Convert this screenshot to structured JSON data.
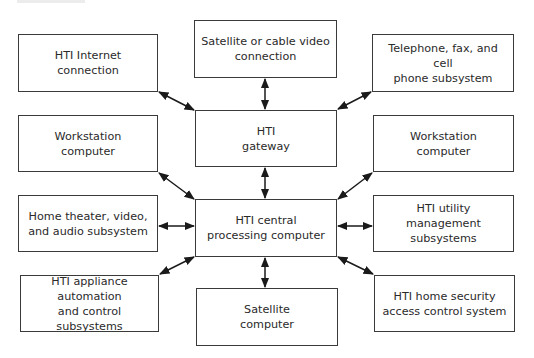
{
  "diagram": {
    "type": "block-diagram",
    "hub": "central",
    "colors": {
      "border": "#3a3a3a",
      "text": "#2a2a2a",
      "arrow": "#1a1a1a",
      "background": "#ffffff"
    },
    "nodes": {
      "internet": {
        "line1": "HTI Internet",
        "line2": "connection"
      },
      "satellite_video": {
        "line1": "Satellite or cable video",
        "line2": "connection"
      },
      "telephone": {
        "line1": "Telephone, fax, and cell",
        "line2": "phone subsystem"
      },
      "workstation_left": {
        "line1": "Workstation",
        "line2": "computer"
      },
      "gateway": {
        "line1": "HTI",
        "line2": "gateway"
      },
      "workstation_right": {
        "line1": "Workstation",
        "line2": "computer"
      },
      "home_theater": {
        "line1": "Home theater, video,",
        "line2": "and audio subsystem"
      },
      "central": {
        "line1": "HTI central",
        "line2": "processing computer"
      },
      "utility": {
        "line1": "HTI utility",
        "line2": "management subsystems"
      },
      "appliance": {
        "line1": "HTI appliance automation",
        "line2": "and control subsystems"
      },
      "satellite_computer": {
        "line1": "Satellite",
        "line2": "computer"
      },
      "security": {
        "line1": "HTI home security",
        "line2": "access control system"
      }
    },
    "edges": [
      {
        "from": "internet",
        "to": "gateway",
        "bidirectional": true
      },
      {
        "from": "satellite_video",
        "to": "gateway",
        "bidirectional": true
      },
      {
        "from": "telephone",
        "to": "gateway",
        "bidirectional": true
      },
      {
        "from": "gateway",
        "to": "central",
        "bidirectional": true
      },
      {
        "from": "workstation_left",
        "to": "central",
        "bidirectional": true
      },
      {
        "from": "workstation_right",
        "to": "central",
        "bidirectional": true
      },
      {
        "from": "home_theater",
        "to": "central",
        "bidirectional": true
      },
      {
        "from": "utility",
        "to": "central",
        "bidirectional": true
      },
      {
        "from": "appliance",
        "to": "central",
        "bidirectional": true
      },
      {
        "from": "satellite_computer",
        "to": "central",
        "bidirectional": true
      },
      {
        "from": "security",
        "to": "central",
        "bidirectional": true
      }
    ]
  }
}
